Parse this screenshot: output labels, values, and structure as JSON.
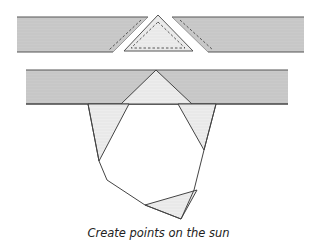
{
  "caption": "Create points on the sun",
  "colors": {
    "strip_fill": "#c9c9c9",
    "strip_edge": "#555555",
    "triangle_fill": "#ececec",
    "line": "#444444",
    "background": "#ffffff"
  },
  "diagram": {
    "top_row": {
      "left_strip": [
        [
          17,
          17
        ],
        [
          148,
          17
        ],
        [
          113,
          52
        ],
        [
          17,
          52
        ]
      ],
      "left_dash": [
        [
          140,
          21
        ],
        [
          108,
          50
        ]
      ],
      "center_triangle": [
        [
          158,
          15
        ],
        [
          193,
          51
        ],
        [
          124,
          51
        ]
      ],
      "center_dash": [
        [
          158,
          22
        ],
        [
          184,
          48
        ],
        [
          132,
          48
        ]
      ],
      "right_strip": [
        [
          172,
          17
        ],
        [
          304,
          17
        ],
        [
          304,
          52
        ],
        [
          208,
          52
        ]
      ],
      "right_dash": [
        [
          180,
          20
        ],
        [
          213,
          50
        ]
      ]
    },
    "middle_row": {
      "strip": [
        [
          26,
          70
        ],
        [
          288,
          70
        ],
        [
          288,
          104
        ],
        [
          26,
          104
        ]
      ],
      "triangle": [
        [
          156,
          70
        ],
        [
          192,
          104
        ],
        [
          121,
          104
        ]
      ]
    },
    "sun_polygon": [
      [
        88,
        104
      ],
      [
        99,
        161
      ],
      [
        107,
        180
      ],
      [
        145,
        205
      ],
      [
        181,
        219
      ],
      [
        194,
        190
      ],
      [
        204,
        150
      ],
      [
        216,
        104
      ]
    ],
    "shaded_points": [
      [
        [
          88,
          104
        ],
        [
          129,
          104
        ],
        [
          99,
          161
        ]
      ],
      [
        [
          178,
          104
        ],
        [
          216,
          104
        ],
        [
          204,
          150
        ]
      ],
      [
        [
          145,
          205
        ],
        [
          197,
          190
        ],
        [
          181,
          219
        ]
      ]
    ]
  }
}
